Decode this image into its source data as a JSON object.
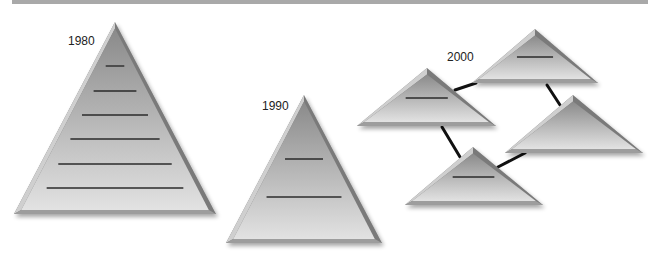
{
  "diagram": {
    "top_banner": {
      "color": "#a9a9a9"
    },
    "colors": {
      "face_top": "#8e8e8e",
      "face_bottom": "#dcdcdc",
      "edge_light": "#cfcfcf",
      "edge_dark": "#7a7a7a",
      "divider": "#2b2b2b",
      "connector": "#111111",
      "label": "#222222"
    },
    "pyramids": [
      {
        "id": "1980",
        "label": "1980",
        "label_pos": [
          68,
          35
        ],
        "apex": [
          115,
          22
        ],
        "base_left": [
          14,
          214
        ],
        "base_right": [
          216,
          214
        ],
        "dividers_y": [
          66,
          91,
          115,
          139,
          164,
          188
        ],
        "layers": 7
      },
      {
        "id": "1990",
        "label": "1990",
        "label_pos": [
          262,
          100
        ],
        "apex": [
          304,
          95
        ],
        "base_left": [
          226,
          243
        ],
        "base_right": [
          382,
          243
        ],
        "dividers_y": [
          159,
          197
        ],
        "layers": 3
      }
    ],
    "network": {
      "label": "2000",
      "label_pos": [
        447,
        51
      ],
      "nodes": [
        {
          "id": "left",
          "apex": [
            427,
            68
          ],
          "base_left": [
            357,
            126
          ],
          "base_right": [
            496,
            126
          ],
          "divider_y": 98
        },
        {
          "id": "top",
          "apex": [
            535,
            29
          ],
          "base_left": [
            472,
            83
          ],
          "base_right": [
            598,
            83
          ],
          "divider_y": 57
        },
        {
          "id": "right",
          "apex": [
            573,
            95
          ],
          "base_left": [
            505,
            153
          ],
          "base_right": [
            643,
            153
          ],
          "divider_y": null
        },
        {
          "id": "bottom",
          "apex": [
            473,
            147
          ],
          "base_left": [
            405,
            205
          ],
          "base_right": [
            543,
            205
          ],
          "divider_y": 177
        }
      ],
      "connectors": [
        {
          "from": "left",
          "to": "top",
          "p1": [
            455,
            90
          ],
          "p2": [
            476,
            83
          ]
        },
        {
          "from": "top",
          "to": "right",
          "p1": [
            547,
            85
          ],
          "p2": [
            560,
            105
          ]
        },
        {
          "from": "left",
          "to": "bottom",
          "p1": [
            442,
            127
          ],
          "p2": [
            460,
            157
          ]
        },
        {
          "from": "bottom",
          "to": "right",
          "p1": [
            498,
            167
          ],
          "p2": [
            525,
            153
          ]
        }
      ]
    }
  }
}
